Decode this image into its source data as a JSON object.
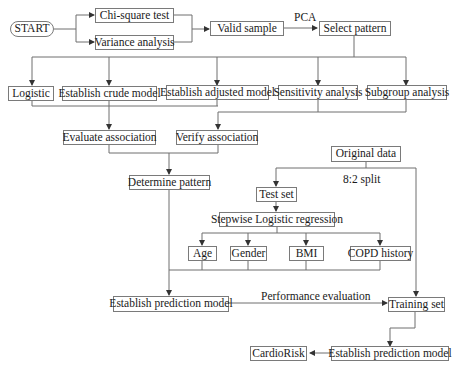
{
  "diagram": {
    "type": "flowchart",
    "nodes": {
      "start": "START",
      "chi_square": "Chi-square test",
      "variance": "Variance analysis",
      "valid_sample": "Valid sample",
      "select_pattern": "Select pattern",
      "logistic": "Logistic",
      "crude_model": "Establish crude model",
      "adjusted_model": "Establish adjusted model",
      "sensitivity": "Sensitivity analysis",
      "subgroup": "Subgroup analysis",
      "evaluate_assoc": "Evaluate association",
      "verify_assoc": "Verify association",
      "determine_pattern": "Determine pattern",
      "original_data": "Original data",
      "test_set": "Test set",
      "stepwise": "Stepwise Logistic regression",
      "age": "Age",
      "gender": "Gender",
      "bmi": "BMI",
      "copd": "COPD history",
      "prediction_model_1": "Establish prediction model",
      "training_set": "Training set",
      "prediction_model_2": "Establish prediction model",
      "cardiorisk": "CardioRisk"
    },
    "edge_labels": {
      "pca": "PCA",
      "split": "8:2 split",
      "performance": "Performance evaluation"
    },
    "edges": [
      [
        "START",
        "Chi-square test"
      ],
      [
        "START",
        "Variance analysis"
      ],
      [
        "Chi-square test",
        "Valid sample"
      ],
      [
        "Variance analysis",
        "Valid sample"
      ],
      [
        "Valid sample",
        "Select pattern",
        "PCA"
      ],
      [
        "Select pattern",
        "Logistic"
      ],
      [
        "Select pattern",
        "Establish crude model"
      ],
      [
        "Select pattern",
        "Establish adjusted model"
      ],
      [
        "Select pattern",
        "Sensitivity analysis"
      ],
      [
        "Select pattern",
        "Subgroup analysis"
      ],
      [
        "Logistic",
        "Evaluate association"
      ],
      [
        "Establish crude model",
        "Evaluate association"
      ],
      [
        "Establish adjusted model",
        "Verify association"
      ],
      [
        "Sensitivity analysis",
        "Verify association"
      ],
      [
        "Subgroup analysis",
        "Verify association"
      ],
      [
        "Evaluate association",
        "Determine pattern"
      ],
      [
        "Verify association",
        "Determine pattern"
      ],
      [
        "Determine pattern",
        "Establish prediction model"
      ],
      [
        "Original data",
        "Test set",
        "8:2 split"
      ],
      [
        "Original data",
        "Training set",
        "8:2 split"
      ],
      [
        "Test set",
        "Stepwise Logistic regression"
      ],
      [
        "Stepwise Logistic regression",
        "Age"
      ],
      [
        "Stepwise Logistic regression",
        "Gender"
      ],
      [
        "Stepwise Logistic regression",
        "BMI"
      ],
      [
        "Stepwise Logistic regression",
        "COPD history"
      ],
      [
        "Age",
        "Establish prediction model"
      ],
      [
        "Gender",
        "Establish prediction model"
      ],
      [
        "BMI",
        "Establish prediction model"
      ],
      [
        "COPD history",
        "Establish prediction model"
      ],
      [
        "Establish prediction model",
        "Training set",
        "Performance evaluation"
      ],
      [
        "Training set",
        "Establish prediction model (2)"
      ],
      [
        "Establish prediction model (2)",
        "CardioRisk"
      ]
    ]
  }
}
